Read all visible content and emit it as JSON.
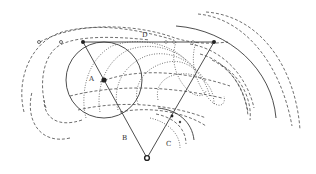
{
  "diagram": {
    "title": "",
    "labels": {
      "A": "A",
      "B": "B",
      "C": "C",
      "D": "D"
    },
    "points": {
      "top_left_vertex": [
        83,
        42
      ],
      "top_right_vertex": [
        214,
        42
      ],
      "bottom_vertex": [
        147,
        158
      ],
      "point_A": [
        104,
        80
      ],
      "point_on_C": [
        172,
        116
      ],
      "small_dot_C": [
        180,
        122
      ]
    },
    "line_dots": [
      [
        39,
        42
      ],
      [
        61,
        42
      ],
      [
        166,
        42
      ],
      [
        174,
        42
      ],
      [
        193,
        42
      ]
    ],
    "colors": {
      "stroke": "#3a3a3a",
      "background": "#ffffff"
    }
  }
}
